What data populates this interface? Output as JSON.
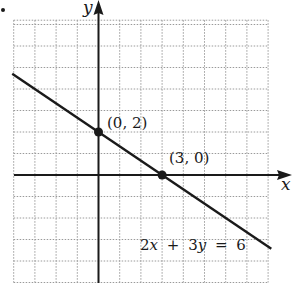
{
  "chart_data": {
    "type": "line",
    "title": "",
    "xlabel": "x",
    "ylabel": "y",
    "xlim": [
      -4,
      8
    ],
    "ylim": [
      -5,
      7.2
    ],
    "grid": true,
    "grid_style": "dotted",
    "series": [
      {
        "name": "2x + 3y = 6",
        "equation": "2x + 3y = 6",
        "x": [
          -4.07,
          8.15
        ],
        "y": [
          4.71,
          -3.43
        ]
      }
    ],
    "points": [
      {
        "label": "(0, 2)",
        "x": 0,
        "y": 2
      },
      {
        "label": "(3, 0)",
        "x": 3,
        "y": 0
      }
    ],
    "annotations": [
      {
        "text": "(0, 2)",
        "x": 0,
        "y": 2
      },
      {
        "text": "(3, 0)",
        "x": 3,
        "y": 0
      },
      {
        "text": "2x + 3y = 6",
        "x": 4.2,
        "y": -3.5
      }
    ]
  },
  "labels": {
    "x_axis": "x",
    "y_axis": "y",
    "point_a": "(0, 2)",
    "point_b": "(3, 0)",
    "eq_2": "2",
    "eq_x": "x",
    "eq_plus": "+",
    "eq_3": "3",
    "eq_y": "y",
    "eq_equals": "=",
    "eq_6": "6"
  },
  "colors": {
    "ink": "#1a1a1a",
    "grid": "#9a9a9a",
    "background": "#ffffff"
  }
}
